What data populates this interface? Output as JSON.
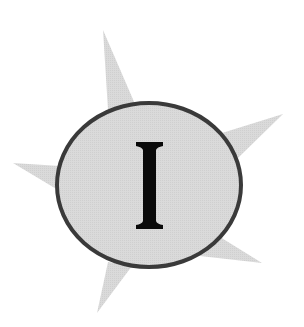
{
  "emblem": {
    "letter": "I",
    "colors": {
      "background": "#ffffff",
      "spikes": "#d4d4d4",
      "circle_fill": "#d9d9d9",
      "circle_stroke": "#3a3a3a",
      "letter": "#0a0a0a"
    },
    "spike_count": 5
  }
}
